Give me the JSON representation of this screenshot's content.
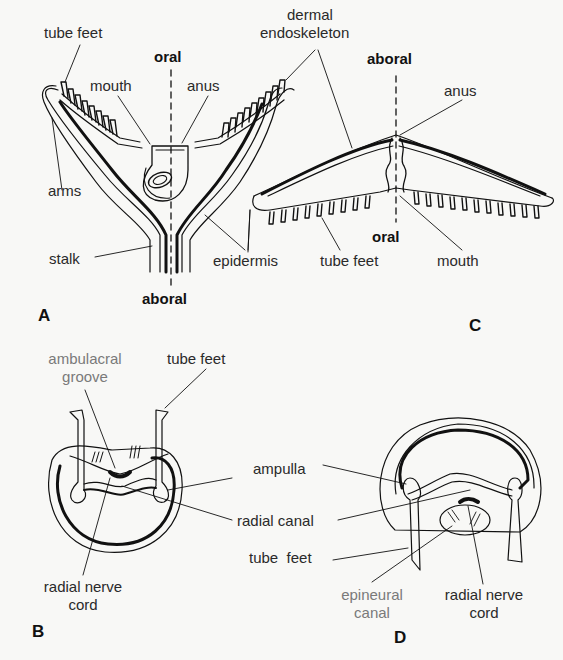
{
  "figure": {
    "panels": [
      {
        "id": "A",
        "label": "A",
        "orientation_top": "oral",
        "orientation_bottom": "aboral",
        "labels": {
          "tube_feet": "tube feet",
          "mouth": "mouth",
          "anus": "anus",
          "arms": "arms",
          "stalk": "stalk",
          "epidermis": "epidermis"
        }
      },
      {
        "id": "C",
        "label": "C",
        "orientation_top": "aboral",
        "orientation_bottom": "oral",
        "labels": {
          "dermal_endoskeleton": "dermal\nendoskeleton",
          "dermal": "dermal",
          "endoskeleton": "endoskeleton",
          "anus": "anus",
          "tube_feet": "tube feet",
          "mouth": "mouth"
        }
      },
      {
        "id": "B",
        "label": "B",
        "labels": {
          "ambulacral": "ambulacral",
          "groove": "groove",
          "tube_feet": "tube feet",
          "radial_nerve": "radial nerve",
          "cord": "cord"
        }
      },
      {
        "id": "D",
        "label": "D",
        "labels": {
          "epineural": "epineural",
          "canal": "canal",
          "radial_nerve": "radial nerve",
          "cord": "cord"
        }
      }
    ],
    "shared_labels": {
      "ampulla": "ampulla",
      "radial_canal": "radial canal",
      "tube_feet": "tube  feet"
    },
    "colors": {
      "ink": "#111111",
      "grey_label": "#7a7a7a",
      "background": "#f8f8f6"
    }
  }
}
